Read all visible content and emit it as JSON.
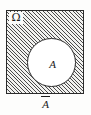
{
  "figure": {
    "kind": "venn-diagram",
    "universe": {
      "name": "universal-set",
      "label": "Ω",
      "fill": "hatched",
      "border_color": "#2b2b2b",
      "hatch_color": "#4a4a4a",
      "hatch_direction": "forward-diagonal"
    },
    "set": {
      "name": "set-a",
      "label": "A",
      "shape": "circle",
      "fill_color": "#ffffff",
      "border_color": "#2b2b2b"
    },
    "caption": {
      "name": "complement-label",
      "base": "A",
      "notation": "overline",
      "meaning": "complement of A"
    }
  }
}
